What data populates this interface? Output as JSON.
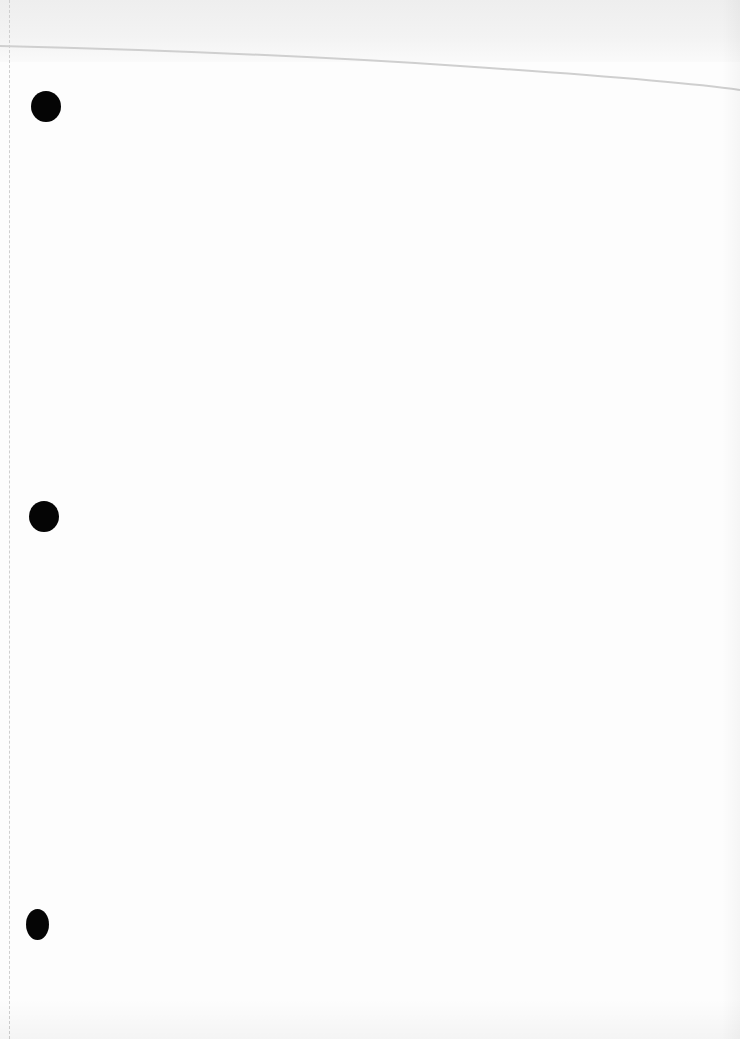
{
  "document": {
    "type": "scanned blank sheet",
    "text_content": "",
    "punch_holes": [
      {
        "position": "top",
        "cx": 46,
        "cy": 106,
        "w": 30,
        "h": 31
      },
      {
        "position": "middle",
        "cx": 44,
        "cy": 516,
        "w": 30,
        "h": 31
      },
      {
        "position": "bottom",
        "cx": 40,
        "cy": 925,
        "w": 22,
        "h": 31
      }
    ],
    "colors": {
      "paper": "#fdfdfd",
      "top_strip": "#efefef",
      "fold_line": "#d0d0d0",
      "punch_hole": "#050505"
    }
  }
}
